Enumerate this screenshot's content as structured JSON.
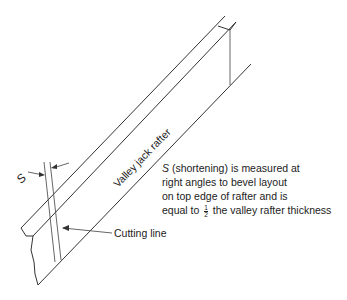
{
  "diagram": {
    "rafter_label": "Valley jack rafter",
    "s_label": "S",
    "cutting_line_label": "Cutting line",
    "note": {
      "s_symbol": "S",
      "line1_rest": " (shortening) is measured at",
      "line2": "right angles to bevel layout",
      "line3": "on top edge of rafter and is",
      "line4_before": "equal to ",
      "fraction_num": "1",
      "fraction_den": "2",
      "line4_after": " the valley rafter thickness"
    }
  }
}
